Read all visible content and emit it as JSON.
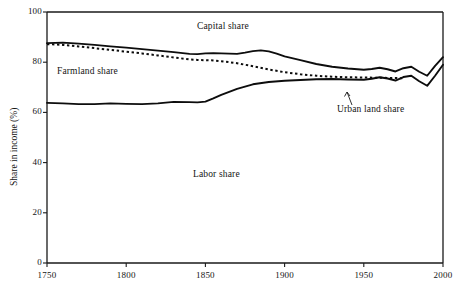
{
  "chart_data": {
    "type": "line",
    "title": "",
    "xlabel": "",
    "ylabel": "Share in income (%)",
    "xlim": [
      1750,
      2000
    ],
    "ylim": [
      0,
      100
    ],
    "xticks": [
      1750,
      1800,
      1850,
      1900,
      1950,
      2000
    ],
    "yticks": [
      0,
      20,
      40,
      60,
      80,
      100
    ],
    "grid": false,
    "legend": "inline-annotations",
    "annotations": [
      {
        "text": "Capital share",
        "x": 1872,
        "y": 96
      },
      {
        "text": "Farmland share",
        "x": 1772,
        "y": 76
      },
      {
        "text": "Labor share",
        "x": 1855,
        "y": 29
      },
      {
        "text": "Urban land share",
        "x": 1947,
        "y": 68,
        "leader_to": {
          "x": 1930,
          "y": 75
        }
      }
    ],
    "series": [
      {
        "name": "Capital share (top boundary)",
        "style": "solid",
        "x": [
          1750,
          1760,
          1770,
          1780,
          1790,
          1800,
          1810,
          1820,
          1830,
          1840,
          1845,
          1850,
          1855,
          1860,
          1870,
          1875,
          1880,
          1885,
          1890,
          1895,
          1900,
          1910,
          1920,
          1930,
          1940,
          1950,
          1955,
          1960,
          1965,
          1970,
          1975,
          1980,
          1985,
          1990,
          1995,
          2000
        ],
        "values": [
          87.6,
          87.8,
          87.4,
          86.9,
          86.3,
          85.8,
          85.2,
          84.6,
          84.0,
          83.3,
          83.2,
          83.5,
          83.6,
          83.5,
          83.3,
          83.8,
          84.4,
          84.7,
          84.3,
          83.4,
          82.3,
          80.8,
          79.3,
          78.2,
          77.5,
          77.0,
          77.3,
          77.8,
          77.2,
          76.3,
          77.6,
          78.2,
          76.2,
          74.6,
          78.5,
          82.0
        ]
      },
      {
        "name": "Farmland share (dotted boundary)",
        "style": "dotted",
        "x": [
          1750,
          1760,
          1770,
          1780,
          1790,
          1800,
          1810,
          1820,
          1830,
          1840,
          1845,
          1850,
          1855,
          1860,
          1870,
          1880,
          1890,
          1900,
          1910,
          1920,
          1930,
          1940,
          1950,
          1960,
          1970,
          1975
        ],
        "values": [
          87.2,
          86.9,
          86.3,
          85.6,
          84.9,
          84.2,
          83.5,
          82.7,
          81.9,
          81.1,
          80.9,
          80.8,
          80.7,
          80.4,
          79.6,
          78.4,
          77.1,
          76.0,
          75.2,
          74.6,
          74.2,
          74.0,
          73.9,
          73.8,
          73.7,
          73.6
        ]
      },
      {
        "name": "Labor share (lower boundary)",
        "style": "solid",
        "x": [
          1750,
          1760,
          1770,
          1780,
          1790,
          1800,
          1810,
          1820,
          1830,
          1840,
          1845,
          1850,
          1855,
          1860,
          1870,
          1880,
          1890,
          1900,
          1910,
          1920,
          1930,
          1940,
          1950,
          1955,
          1960,
          1965,
          1970,
          1975,
          1980,
          1985,
          1990,
          1995,
          2000
        ],
        "values": [
          63.8,
          63.6,
          63.3,
          63.3,
          63.6,
          63.4,
          63.3,
          63.6,
          64.2,
          64.1,
          64.0,
          64.3,
          65.6,
          67.0,
          69.4,
          71.2,
          72.1,
          72.6,
          72.9,
          73.2,
          73.3,
          73.1,
          73.0,
          73.4,
          74.0,
          73.5,
          72.7,
          74.1,
          74.6,
          72.4,
          70.6,
          74.6,
          79.0
        ]
      }
    ]
  },
  "axes": {
    "y_tick_labels": [
      "0",
      "20",
      "40",
      "60",
      "80",
      "100"
    ],
    "x_tick_labels": [
      "1750",
      "1800",
      "1850",
      "1900",
      "1950",
      "2000"
    ],
    "y_axis_title": "Share in income (%)"
  },
  "labels": {
    "capital_share": "Capital share",
    "farmland_share": "Farmland share",
    "labor_share": "Labor share",
    "urban_land_share": "Urban land share"
  },
  "colors": {
    "ink": "#0d0d0d",
    "background": "#ffffff"
  }
}
